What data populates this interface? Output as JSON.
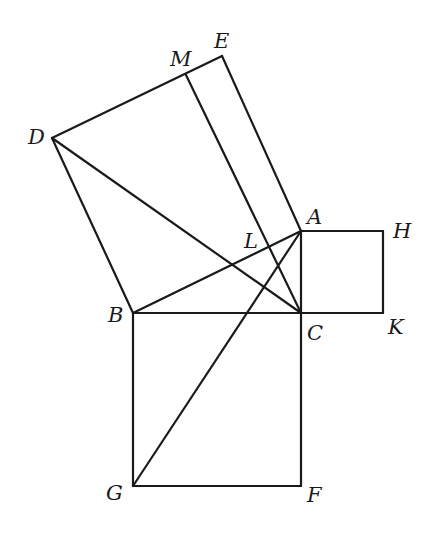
{
  "diagram": {
    "type": "geometry",
    "points": {
      "A": {
        "x": 301,
        "y": 231
      },
      "B": {
        "x": 133,
        "y": 313
      },
      "C": {
        "x": 301,
        "y": 313
      },
      "D": {
        "x": 52,
        "y": 138
      },
      "E": {
        "x": 222,
        "y": 56
      },
      "M": {
        "x": 186,
        "y": 75
      },
      "H": {
        "x": 383,
        "y": 231
      },
      "K": {
        "x": 383,
        "y": 313
      },
      "G": {
        "x": 133,
        "y": 486
      },
      "F": {
        "x": 301,
        "y": 486
      }
    },
    "segments": [
      [
        "D",
        "E"
      ],
      [
        "E",
        "A"
      ],
      [
        "D",
        "B"
      ],
      [
        "B",
        "A"
      ],
      [
        "A",
        "H"
      ],
      [
        "H",
        "K"
      ],
      [
        "K",
        "C"
      ],
      [
        "A",
        "C"
      ],
      [
        "B",
        "C"
      ],
      [
        "B",
        "G"
      ],
      [
        "G",
        "F"
      ],
      [
        "F",
        "C"
      ],
      [
        "D",
        "C"
      ],
      [
        "G",
        "A"
      ],
      [
        "M",
        "C"
      ]
    ],
    "labels": [
      {
        "text": "E",
        "x": 214,
        "y": 48
      },
      {
        "text": "M",
        "x": 170,
        "y": 66
      },
      {
        "text": "D",
        "x": 28,
        "y": 144
      },
      {
        "text": "A",
        "x": 307,
        "y": 224
      },
      {
        "text": "H",
        "x": 393,
        "y": 238
      },
      {
        "text": "L",
        "x": 244,
        "y": 248
      },
      {
        "text": "B",
        "x": 108,
        "y": 322
      },
      {
        "text": "C",
        "x": 307,
        "y": 340
      },
      {
        "text": "K",
        "x": 388,
        "y": 334
      },
      {
        "text": "G",
        "x": 106,
        "y": 500
      },
      {
        "text": "F",
        "x": 307,
        "y": 502
      }
    ]
  }
}
